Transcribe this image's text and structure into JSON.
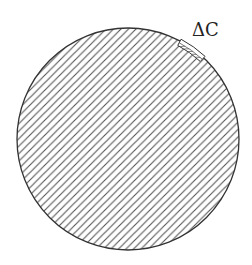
{
  "diagram": {
    "type": "hatched-circle",
    "circle": {
      "cx": 128,
      "cy": 139,
      "r": 111
    },
    "hatch": {
      "angle_deg": 45,
      "spacing_px": 5.3,
      "color": "#555555"
    },
    "outline_color": "#333333",
    "segment": {
      "label": "ΔC",
      "start_angle_deg": -62,
      "end_angle_deg": -47,
      "band_width_px": 5
    },
    "label_position": {
      "x": 192,
      "y": 36
    }
  }
}
